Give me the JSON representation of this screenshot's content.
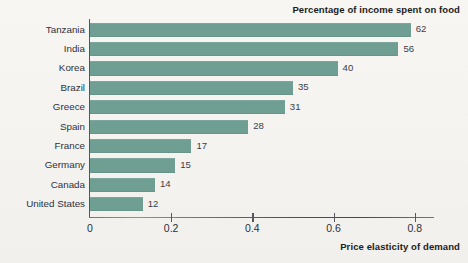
{
  "chart_data": {
    "type": "bar",
    "orientation": "horizontal",
    "title": "Percentage of income spent on food",
    "xlabel": "Price elasticity of demand",
    "ylabel": "",
    "xlim": [
      0,
      0.85
    ],
    "grid": false,
    "legend": null,
    "bar_color": "#6f9e93",
    "background_color": "#f6f5f1",
    "xticks": [
      "0",
      "0.2",
      "0.4",
      "0.6",
      "0.8"
    ],
    "xtick_values": [
      0,
      0.2,
      0.4,
      0.6,
      0.8
    ],
    "categories": [
      "Tanzania",
      "India",
      "Korea",
      "Brazil",
      "Greece",
      "Spain",
      "France",
      "Germany",
      "Canada",
      "United States"
    ],
    "values": [
      0.79,
      0.76,
      0.61,
      0.5,
      0.48,
      0.39,
      0.25,
      0.21,
      0.16,
      0.13
    ],
    "data_labels": [
      "62",
      "56",
      "40",
      "35",
      "31",
      "28",
      "17",
      "15",
      "14",
      "12"
    ],
    "data_label_meaning": "Percentage of income spent on food",
    "points": [
      {
        "category": "Tanzania",
        "elasticity": 0.79,
        "pct_income_on_food": 62
      },
      {
        "category": "India",
        "elasticity": 0.76,
        "pct_income_on_food": 56
      },
      {
        "category": "Korea",
        "elasticity": 0.61,
        "pct_income_on_food": 40
      },
      {
        "category": "Brazil",
        "elasticity": 0.5,
        "pct_income_on_food": 35
      },
      {
        "category": "Greece",
        "elasticity": 0.48,
        "pct_income_on_food": 31
      },
      {
        "category": "Spain",
        "elasticity": 0.39,
        "pct_income_on_food": 28
      },
      {
        "category": "France",
        "elasticity": 0.25,
        "pct_income_on_food": 17
      },
      {
        "category": "Germany",
        "elasticity": 0.21,
        "pct_income_on_food": 15
      },
      {
        "category": "Canada",
        "elasticity": 0.16,
        "pct_income_on_food": 14
      },
      {
        "category": "United States",
        "elasticity": 0.13,
        "pct_income_on_food": 12
      }
    ]
  }
}
